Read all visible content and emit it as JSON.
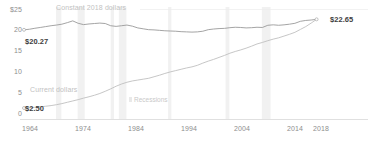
{
  "chart_data": {
    "type": "line",
    "title": "",
    "xlabel": "",
    "ylabel": "",
    "xlim": [
      1964,
      2019
    ],
    "ylim": [
      0,
      25
    ],
    "grid": false,
    "legend_position": "inline",
    "x_ticks": [
      "1964",
      "1974",
      "1984",
      "1994",
      "2004",
      "2014",
      "2018"
    ],
    "x_tick_values": [
      1964,
      1974,
      1984,
      1994,
      2004,
      2014,
      2018
    ],
    "y_ticks": [
      "$25",
      "20",
      "15",
      "10",
      "5",
      "0"
    ],
    "y_tick_values": [
      25,
      20,
      15,
      10,
      5,
      0
    ],
    "annotations": {
      "start_value": "$20.27",
      "end_value": "$22.65",
      "current_start_value": "$2.50",
      "recessions_label": "Recessions"
    },
    "series": [
      {
        "name": "Constant 2018 dollars",
        "color": "#9a9a9a",
        "label_position": "top-left",
        "x": [
          1964,
          1965,
          1966,
          1967,
          1968,
          1969,
          1970,
          1971,
          1972,
          1973,
          1974,
          1975,
          1976,
          1977,
          1978,
          1979,
          1980,
          1981,
          1982,
          1983,
          1984,
          1985,
          1986,
          1987,
          1988,
          1989,
          1990,
          1991,
          1992,
          1993,
          1994,
          1995,
          1996,
          1997,
          1998,
          1999,
          2000,
          2001,
          2002,
          2003,
          2004,
          2005,
          2006,
          2007,
          2008,
          2009,
          2010,
          2011,
          2012,
          2013,
          2014,
          2015,
          2016,
          2017,
          2018
        ],
        "values": [
          20.27,
          20.4,
          20.62,
          20.8,
          21.0,
          21.2,
          21.35,
          21.55,
          21.9,
          22.3,
          21.75,
          21.45,
          21.6,
          21.7,
          21.8,
          21.7,
          21.2,
          21.05,
          21.2,
          21.35,
          21.1,
          20.7,
          20.5,
          20.3,
          20.25,
          20.15,
          20.05,
          20.0,
          19.95,
          19.85,
          19.8,
          19.75,
          19.8,
          19.95,
          20.3,
          20.45,
          20.55,
          20.6,
          20.75,
          20.85,
          20.8,
          20.7,
          20.75,
          20.85,
          20.8,
          21.3,
          21.4,
          21.3,
          21.4,
          21.55,
          21.75,
          22.2,
          22.4,
          22.5,
          22.65
        ]
      },
      {
        "name": "Current dollars",
        "color": "#c0c0c0",
        "label_position": "bottom-left",
        "x": [
          1964,
          1965,
          1966,
          1967,
          1968,
          1969,
          1970,
          1971,
          1972,
          1973,
          1974,
          1975,
          1976,
          1977,
          1978,
          1979,
          1980,
          1981,
          1982,
          1983,
          1984,
          1985,
          1986,
          1987,
          1988,
          1989,
          1990,
          1991,
          1992,
          1993,
          1994,
          1995,
          1996,
          1997,
          1998,
          1999,
          2000,
          2001,
          2002,
          2003,
          2004,
          2005,
          2006,
          2007,
          2008,
          2009,
          2010,
          2011,
          2012,
          2013,
          2014,
          2015,
          2016,
          2017,
          2018
        ],
        "values": [
          2.5,
          2.55,
          2.65,
          2.75,
          2.9,
          3.05,
          3.25,
          3.5,
          3.8,
          4.1,
          4.4,
          4.75,
          5.05,
          5.4,
          5.8,
          6.3,
          6.85,
          7.45,
          7.95,
          8.35,
          8.65,
          8.85,
          9.05,
          9.25,
          9.6,
          9.95,
          10.35,
          10.7,
          11.0,
          11.3,
          11.6,
          11.85,
          12.2,
          12.7,
          13.15,
          13.55,
          14.0,
          14.45,
          14.95,
          15.35,
          15.7,
          16.1,
          16.55,
          17.05,
          17.4,
          17.8,
          18.15,
          18.45,
          18.85,
          19.25,
          19.7,
          20.35,
          21.0,
          21.8,
          22.65
        ]
      }
    ],
    "recession_bands": [
      {
        "start": 1969.9,
        "end": 1970.9
      },
      {
        "start": 1973.9,
        "end": 1975.2
      },
      {
        "start": 1980.0,
        "end": 1980.6
      },
      {
        "start": 1981.5,
        "end": 1982.9
      },
      {
        "start": 1990.6,
        "end": 1991.2
      },
      {
        "start": 2001.2,
        "end": 2001.9
      },
      {
        "start": 2007.9,
        "end": 2009.5
      }
    ],
    "recession_band_color": "#f1f1f1",
    "axis_color": "#d8d8d8",
    "tick_text_color": "#8e8e8e"
  }
}
